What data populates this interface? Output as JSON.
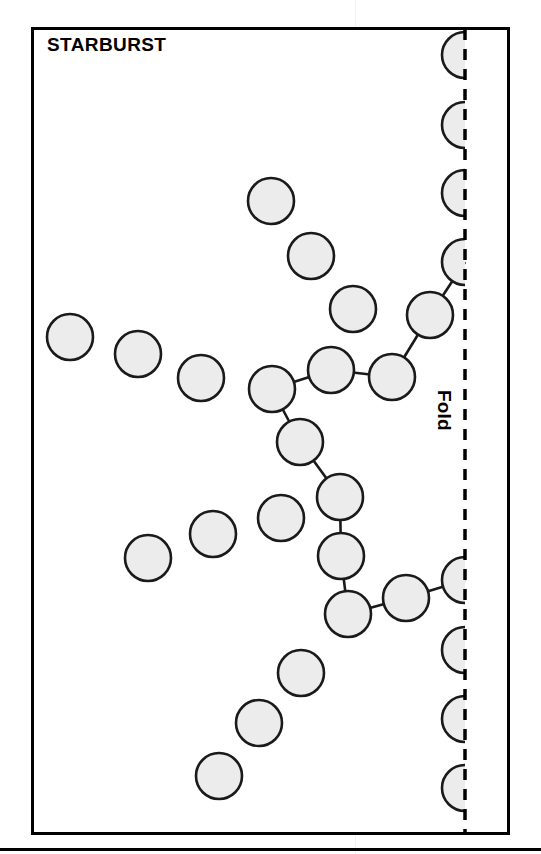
{
  "page": {
    "title": "STARBURST",
    "fold_label": "Fold",
    "background_color": "#ffffff",
    "frame_color": "#000000",
    "node_fill": "#ececec",
    "node_stroke": "#1a1a1a",
    "edge_color": "#1a1a1a",
    "fold_line_color": "#000000",
    "fold_line_style": "dashed"
  },
  "diagram": {
    "type": "network-topology",
    "name": "Starburst network topology",
    "node_radius": 23,
    "fold_x": 465,
    "frame": {
      "x": 31,
      "y": 27,
      "width": 479,
      "height": 808
    },
    "nodes": [
      {
        "id": "f1",
        "cx": 465,
        "cy": 55,
        "clipped": true,
        "label": ""
      },
      {
        "id": "f2",
        "cx": 465,
        "cy": 125,
        "clipped": true,
        "label": ""
      },
      {
        "id": "f3",
        "cx": 465,
        "cy": 193,
        "clipped": true,
        "label": ""
      },
      {
        "id": "f4",
        "cx": 465,
        "cy": 262,
        "clipped": true,
        "label": ""
      },
      {
        "id": "a1",
        "cx": 430,
        "cy": 315,
        "clipped": false,
        "label": ""
      },
      {
        "id": "a2",
        "cx": 392,
        "cy": 377,
        "clipped": false,
        "label": ""
      },
      {
        "id": "a3",
        "cx": 331,
        "cy": 370,
        "clipped": false,
        "label": ""
      },
      {
        "id": "hub",
        "cx": 272,
        "cy": 389,
        "clipped": false,
        "label": ""
      },
      {
        "id": "b1",
        "cx": 271,
        "cy": 201,
        "clipped": false,
        "label": ""
      },
      {
        "id": "b2",
        "cx": 311,
        "cy": 256,
        "clipped": false,
        "label": ""
      },
      {
        "id": "b3",
        "cx": 353,
        "cy": 309,
        "clipped": false,
        "label": ""
      },
      {
        "id": "c1",
        "cx": 70,
        "cy": 337,
        "clipped": false,
        "label": ""
      },
      {
        "id": "c2",
        "cx": 138,
        "cy": 354,
        "clipped": false,
        "label": ""
      },
      {
        "id": "c3",
        "cx": 201,
        "cy": 378,
        "clipped": false,
        "label": ""
      },
      {
        "id": "d1",
        "cx": 300,
        "cy": 442,
        "clipped": false,
        "label": ""
      },
      {
        "id": "d2",
        "cx": 340,
        "cy": 497,
        "clipped": false,
        "label": ""
      },
      {
        "id": "d3",
        "cx": 341,
        "cy": 556,
        "clipped": false,
        "label": ""
      },
      {
        "id": "d4",
        "cx": 348,
        "cy": 614,
        "clipped": false,
        "label": ""
      },
      {
        "id": "e1",
        "cx": 406,
        "cy": 598,
        "clipped": false,
        "label": ""
      },
      {
        "id": "f5",
        "cx": 465,
        "cy": 580,
        "clipped": true,
        "label": ""
      },
      {
        "id": "f6",
        "cx": 465,
        "cy": 650,
        "clipped": true,
        "label": ""
      },
      {
        "id": "f7",
        "cx": 465,
        "cy": 719,
        "clipped": true,
        "label": ""
      },
      {
        "id": "f8",
        "cx": 465,
        "cy": 788,
        "clipped": true,
        "label": ""
      },
      {
        "id": "g1",
        "cx": 148,
        "cy": 558,
        "clipped": false,
        "label": ""
      },
      {
        "id": "g2",
        "cx": 213,
        "cy": 534,
        "clipped": false,
        "label": ""
      },
      {
        "id": "g3",
        "cx": 281,
        "cy": 518,
        "clipped": false,
        "label": ""
      },
      {
        "id": "h1",
        "cx": 301,
        "cy": 673,
        "clipped": false,
        "label": ""
      },
      {
        "id": "h2",
        "cx": 259,
        "cy": 723,
        "clipped": false,
        "label": ""
      },
      {
        "id": "h3",
        "cx": 219,
        "cy": 776,
        "clipped": false,
        "label": ""
      }
    ],
    "edges": [
      {
        "from": "f4",
        "to": "a1"
      },
      {
        "from": "a1",
        "to": "a2"
      },
      {
        "from": "a2",
        "to": "a3"
      },
      {
        "from": "a3",
        "to": "hub"
      },
      {
        "from": "hub",
        "to": "d1"
      },
      {
        "from": "d1",
        "to": "d2"
      },
      {
        "from": "d2",
        "to": "d3"
      },
      {
        "from": "d3",
        "to": "d4"
      },
      {
        "from": "d4",
        "to": "e1"
      },
      {
        "from": "e1",
        "to": "f5"
      }
    ],
    "node_count": 29,
    "edge_count": 10
  }
}
